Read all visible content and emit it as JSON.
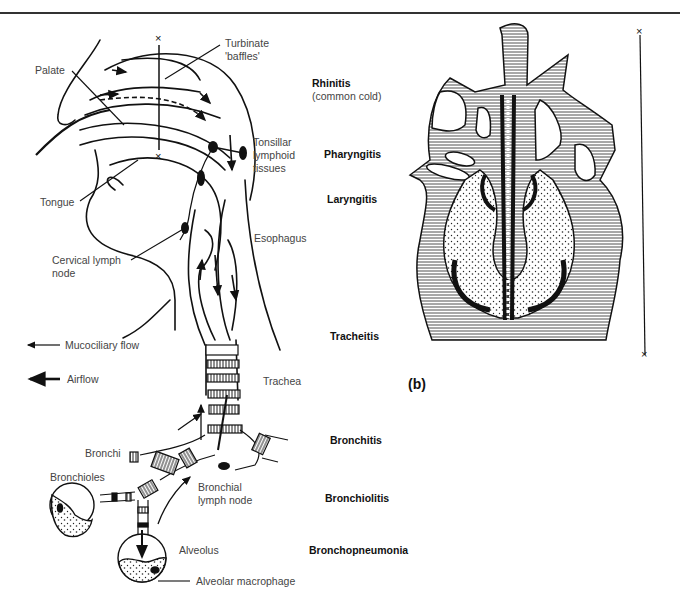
{
  "figure": {
    "header_rule": true,
    "panel_b_label": "(b)",
    "panel_a_label_partial": "(a)"
  },
  "anatomy_labels": {
    "palate": "Palate",
    "turbinate_line1": "Turbinate",
    "turbinate_line2": "'baffles'",
    "tonsillar_line1": "Tonsillar",
    "tonsillar_line2": "lymphoid",
    "tonsillar_line3": "tissues",
    "tongue": "Tongue",
    "esophagus": "Esophagus",
    "cervical_line1": "Cervical lymph",
    "cervical_line2": "node",
    "trachea": "Trachea",
    "bronchi": "Bronchi",
    "bronchioles": "Bronchioles",
    "bronchial_line1": "Bronchial",
    "bronchial_line2": "lymph node",
    "alveolus": "Alveolus",
    "alveolar_macrophage": "Alveolar macrophage"
  },
  "legend": {
    "mucociliary": "Mucociliary flow",
    "airflow": "Airflow"
  },
  "diseases": [
    {
      "name": "Rhinitis",
      "sub": "(common cold)"
    },
    {
      "name": "Pharyngitis"
    },
    {
      "name": "Laryngitis"
    },
    {
      "name": "Tracheitis"
    },
    {
      "name": "Bronchitis"
    },
    {
      "name": "Bronchiolitis"
    },
    {
      "name": "Bronchopneumonia"
    }
  ]
}
